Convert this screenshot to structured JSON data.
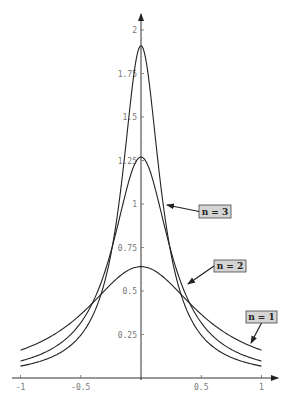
{
  "chart_data": {
    "type": "line",
    "title": "",
    "xlabel": "",
    "ylabel": "",
    "xlim": [
      -1,
      1
    ],
    "ylim": [
      0,
      2
    ],
    "grid": false,
    "x_ticks": [
      "-1",
      "-0.5",
      "0.5",
      "1"
    ],
    "y_ticks": [
      "0.25",
      "0.5",
      "0.75",
      "1",
      "1.25",
      "1.5",
      "1.75",
      "2"
    ],
    "series": [
      {
        "name": "n = 1",
        "peak": 0.64,
        "x": [
          -1,
          -0.5,
          0,
          0.5,
          1
        ],
        "values": [
          0.16,
          0.36,
          0.64,
          0.36,
          0.16
        ]
      },
      {
        "name": "n = 2",
        "peak": 1.27,
        "x": [
          -1,
          -0.5,
          0,
          0.5,
          1
        ],
        "values": [
          0.07,
          0.31,
          1.27,
          0.31,
          0.07
        ]
      },
      {
        "name": "n = 3",
        "peak": 1.91,
        "x": [
          -1,
          -0.5,
          0,
          0.5,
          1
        ],
        "values": [
          0.04,
          0.21,
          1.91,
          0.21,
          0.04
        ]
      }
    ],
    "annotations": [
      {
        "text": "n = 3",
        "box": [
          199,
          205,
          32,
          13
        ],
        "arrow_to": [
          167,
          205
        ]
      },
      {
        "text": "n = 2",
        "box": [
          214,
          260,
          32,
          12
        ],
        "arrow_to": [
          188,
          284
        ]
      },
      {
        "text": "n = 1",
        "box": [
          246,
          311,
          31,
          12
        ],
        "arrow_to": [
          251,
          343
        ]
      }
    ]
  }
}
